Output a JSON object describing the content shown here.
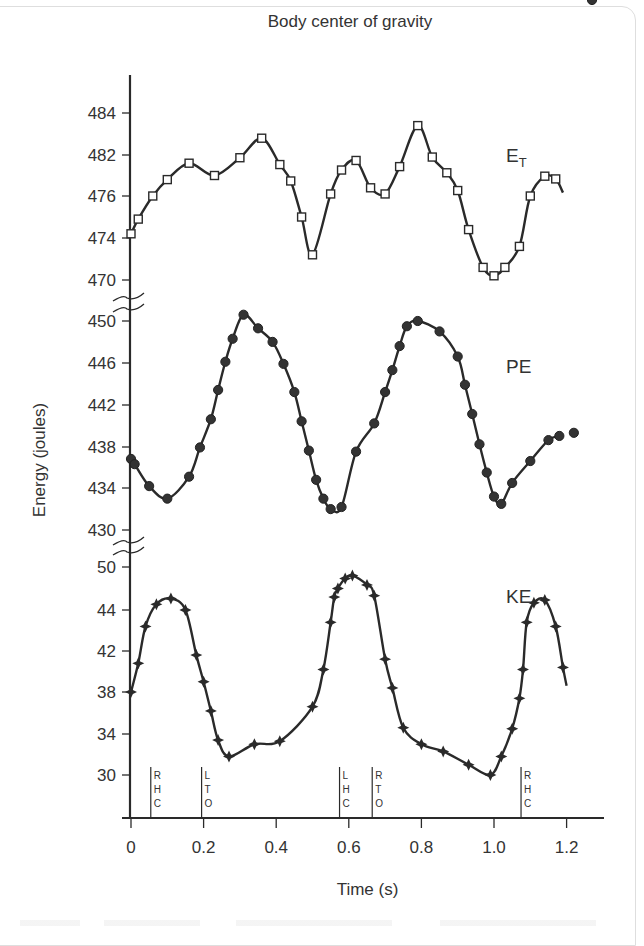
{
  "chart_data": {
    "type": "line",
    "title": "Body center of gravity",
    "xlabel": "Time (s)",
    "ylabel": "Energy (joules)",
    "x_ticks": [
      "0",
      "0.2",
      "0.4",
      "0.6",
      "0.8",
      "1.0",
      "1.2"
    ],
    "xlim": [
      0,
      1.3
    ],
    "grid": false,
    "legend": "inline labels at right of each curve",
    "panels": [
      {
        "name": "E_T",
        "label": "E",
        "label_sub": "T",
        "marker": "open-square",
        "y_ticks": [
          "484",
          "482",
          "476",
          "474",
          "470"
        ],
        "x": [
          0.0,
          0.02,
          0.06,
          0.1,
          0.16,
          0.23,
          0.3,
          0.36,
          0.41,
          0.44,
          0.47,
          0.5,
          0.55,
          0.58,
          0.62,
          0.66,
          0.7,
          0.74,
          0.79,
          0.83,
          0.87,
          0.9,
          0.93,
          0.97,
          1.0,
          1.03,
          1.07,
          1.1,
          1.14,
          1.17,
          1.19
        ],
        "values": [
          474.2,
          474.9,
          476.0,
          478.4,
          480.8,
          479.0,
          481.6,
          482.8,
          480.6,
          478.2,
          475.0,
          472.4,
          476.3,
          479.8,
          481.2,
          477.2,
          476.3,
          480.3,
          483.4,
          481.7,
          479.4,
          476.8,
          474.4,
          471.2,
          470.4,
          471.2,
          473.2,
          476.0,
          478.9,
          478.5,
          476.5
        ]
      },
      {
        "name": "PE",
        "label": "PE",
        "marker": "filled-circle",
        "y_ticks": [
          "450",
          "446",
          "442",
          "438",
          "430"
        ],
        "y_ticks_all": [
          "450",
          "446",
          "442",
          "438",
          "434",
          "430"
        ],
        "x": [
          0.0,
          0.01,
          0.05,
          0.1,
          0.16,
          0.19,
          0.22,
          0.24,
          0.26,
          0.28,
          0.31,
          0.35,
          0.39,
          0.42,
          0.45,
          0.47,
          0.49,
          0.51,
          0.53,
          0.55,
          0.58,
          0.62,
          0.67,
          0.7,
          0.72,
          0.74,
          0.76,
          0.79,
          0.85,
          0.9,
          0.92,
          0.94,
          0.96,
          0.98,
          1.0,
          1.02,
          1.05,
          1.1,
          1.15,
          1.18,
          1.22,
          1.27
        ],
        "values": [
          436.8,
          436.3,
          434.2,
          433.0,
          435.1,
          437.9,
          440.6,
          443.4,
          446.1,
          448.3,
          450.6,
          449.3,
          448.0,
          445.9,
          443.2,
          440.4,
          437.6,
          434.8,
          433.0,
          432.0,
          432.2,
          437.5,
          440.2,
          443.2,
          445.3,
          447.6,
          449.5,
          450.0,
          449.0,
          446.6,
          443.9,
          441.1,
          438.2,
          435.5,
          433.2,
          432.5,
          434.5,
          436.6,
          438.6,
          439.0,
          439.3
        ]
      },
      {
        "name": "KE",
        "label": "KE",
        "marker": "filled-star",
        "y_ticks": [
          "50",
          "44",
          "42",
          "38",
          "34",
          "30"
        ],
        "x": [
          0.0,
          0.02,
          0.04,
          0.07,
          0.11,
          0.15,
          0.18,
          0.2,
          0.22,
          0.24,
          0.27,
          0.34,
          0.41,
          0.5,
          0.53,
          0.55,
          0.56,
          0.57,
          0.59,
          0.61,
          0.65,
          0.67,
          0.7,
          0.72,
          0.75,
          0.8,
          0.86,
          0.93,
          0.99,
          1.02,
          1.05,
          1.07,
          1.08,
          1.09,
          1.11,
          1.14,
          1.17,
          1.19,
          1.2
        ],
        "values": [
          38.0,
          40.8,
          43.2,
          44.8,
          45.6,
          44.0,
          41.6,
          39.0,
          36.2,
          33.4,
          31.8,
          33.0,
          33.3,
          36.6,
          40.2,
          43.4,
          45.8,
          47.0,
          48.4,
          48.8,
          47.5,
          46.0,
          41.2,
          38.4,
          34.6,
          33.0,
          32.3,
          31.0,
          30.0,
          31.8,
          34.5,
          37.4,
          40.2,
          43.4,
          45.0,
          45.4,
          43.2,
          40.4,
          38.6
        ]
      }
    ],
    "gait_events": [
      {
        "x": 0.06,
        "label": [
          "R",
          "H",
          "C"
        ]
      },
      {
        "x": 0.2,
        "label": [
          "L",
          "T",
          "O"
        ]
      },
      {
        "x": 0.58,
        "label": [
          "L",
          "H",
          "C"
        ]
      },
      {
        "x": 0.67,
        "label": [
          "R",
          "T",
          "O"
        ]
      },
      {
        "x": 1.08,
        "label": [
          "R",
          "H",
          "C"
        ]
      }
    ]
  },
  "labels": {
    "title": "Body center of gravity",
    "xlabel": "Time (s)",
    "ylabel": "Energy (joules)"
  }
}
